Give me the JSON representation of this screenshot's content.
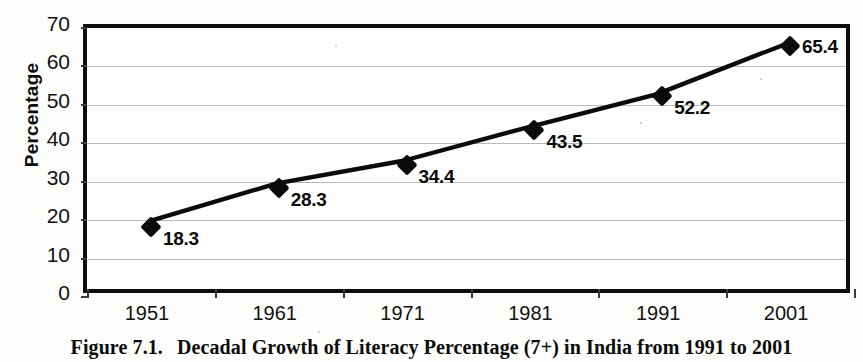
{
  "caption": {
    "number": "Figure 7.1.",
    "text": "Decadal Growth of Literacy Percentage (7+) in India from 1991 to 2001"
  },
  "chart_data": {
    "type": "line",
    "title": "Decadal Growth of Literacy Percentage (7+) in India from 1991 to 2001",
    "xlabel": "",
    "ylabel": "Percentage",
    "categories": [
      "1951",
      "1961",
      "1971",
      "1981",
      "1991",
      "2001"
    ],
    "values": [
      18.3,
      28.3,
      34.4,
      43.5,
      52.2,
      65.4
    ],
    "point_labels": [
      "18.3",
      "28.3",
      "34.4",
      "43.5",
      "52.2",
      "65.4"
    ],
    "ylim": [
      0,
      70
    ],
    "ytick_labels": [
      "70",
      "60",
      "50",
      "40",
      "30",
      "20",
      "10",
      "0"
    ],
    "ytick_values": [
      70,
      60,
      50,
      40,
      30,
      20,
      10,
      0
    ],
    "grid": true,
    "legend": false,
    "marker": "diamond",
    "series_color": "#0b0b0b",
    "grid_color": "#b9b9b9",
    "axis_color": "#0d0d0d",
    "background": "#ffffff"
  }
}
